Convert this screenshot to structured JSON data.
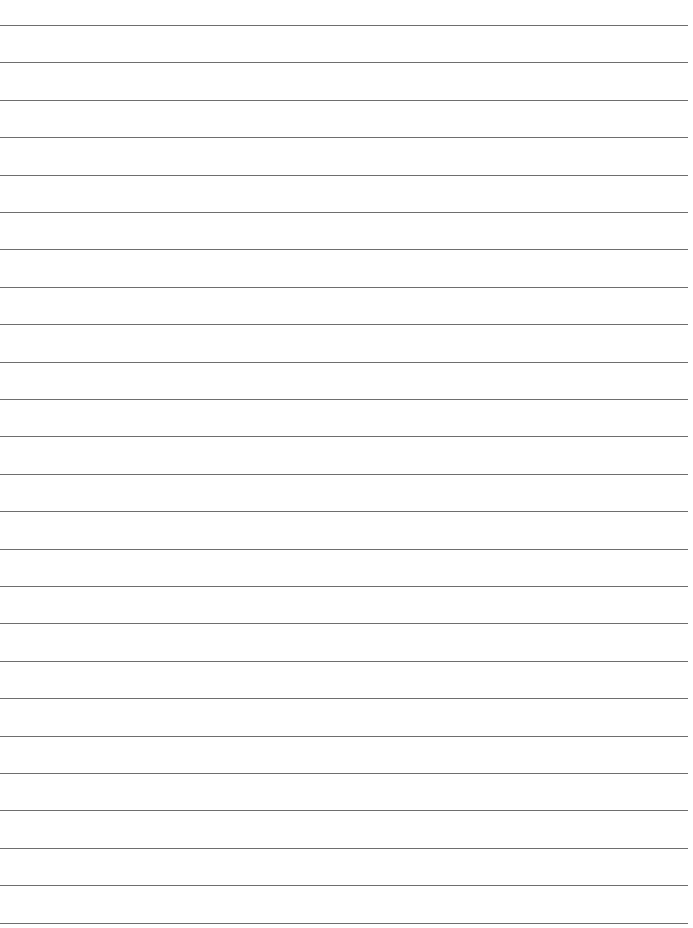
{
  "page": {
    "type": "lined-paper",
    "background_color": "#ffffff",
    "line_color": "#6e6e6e",
    "line_count": 25,
    "first_line_y": 25,
    "line_spacing": 37.4,
    "line_width": 688,
    "text": ""
  }
}
